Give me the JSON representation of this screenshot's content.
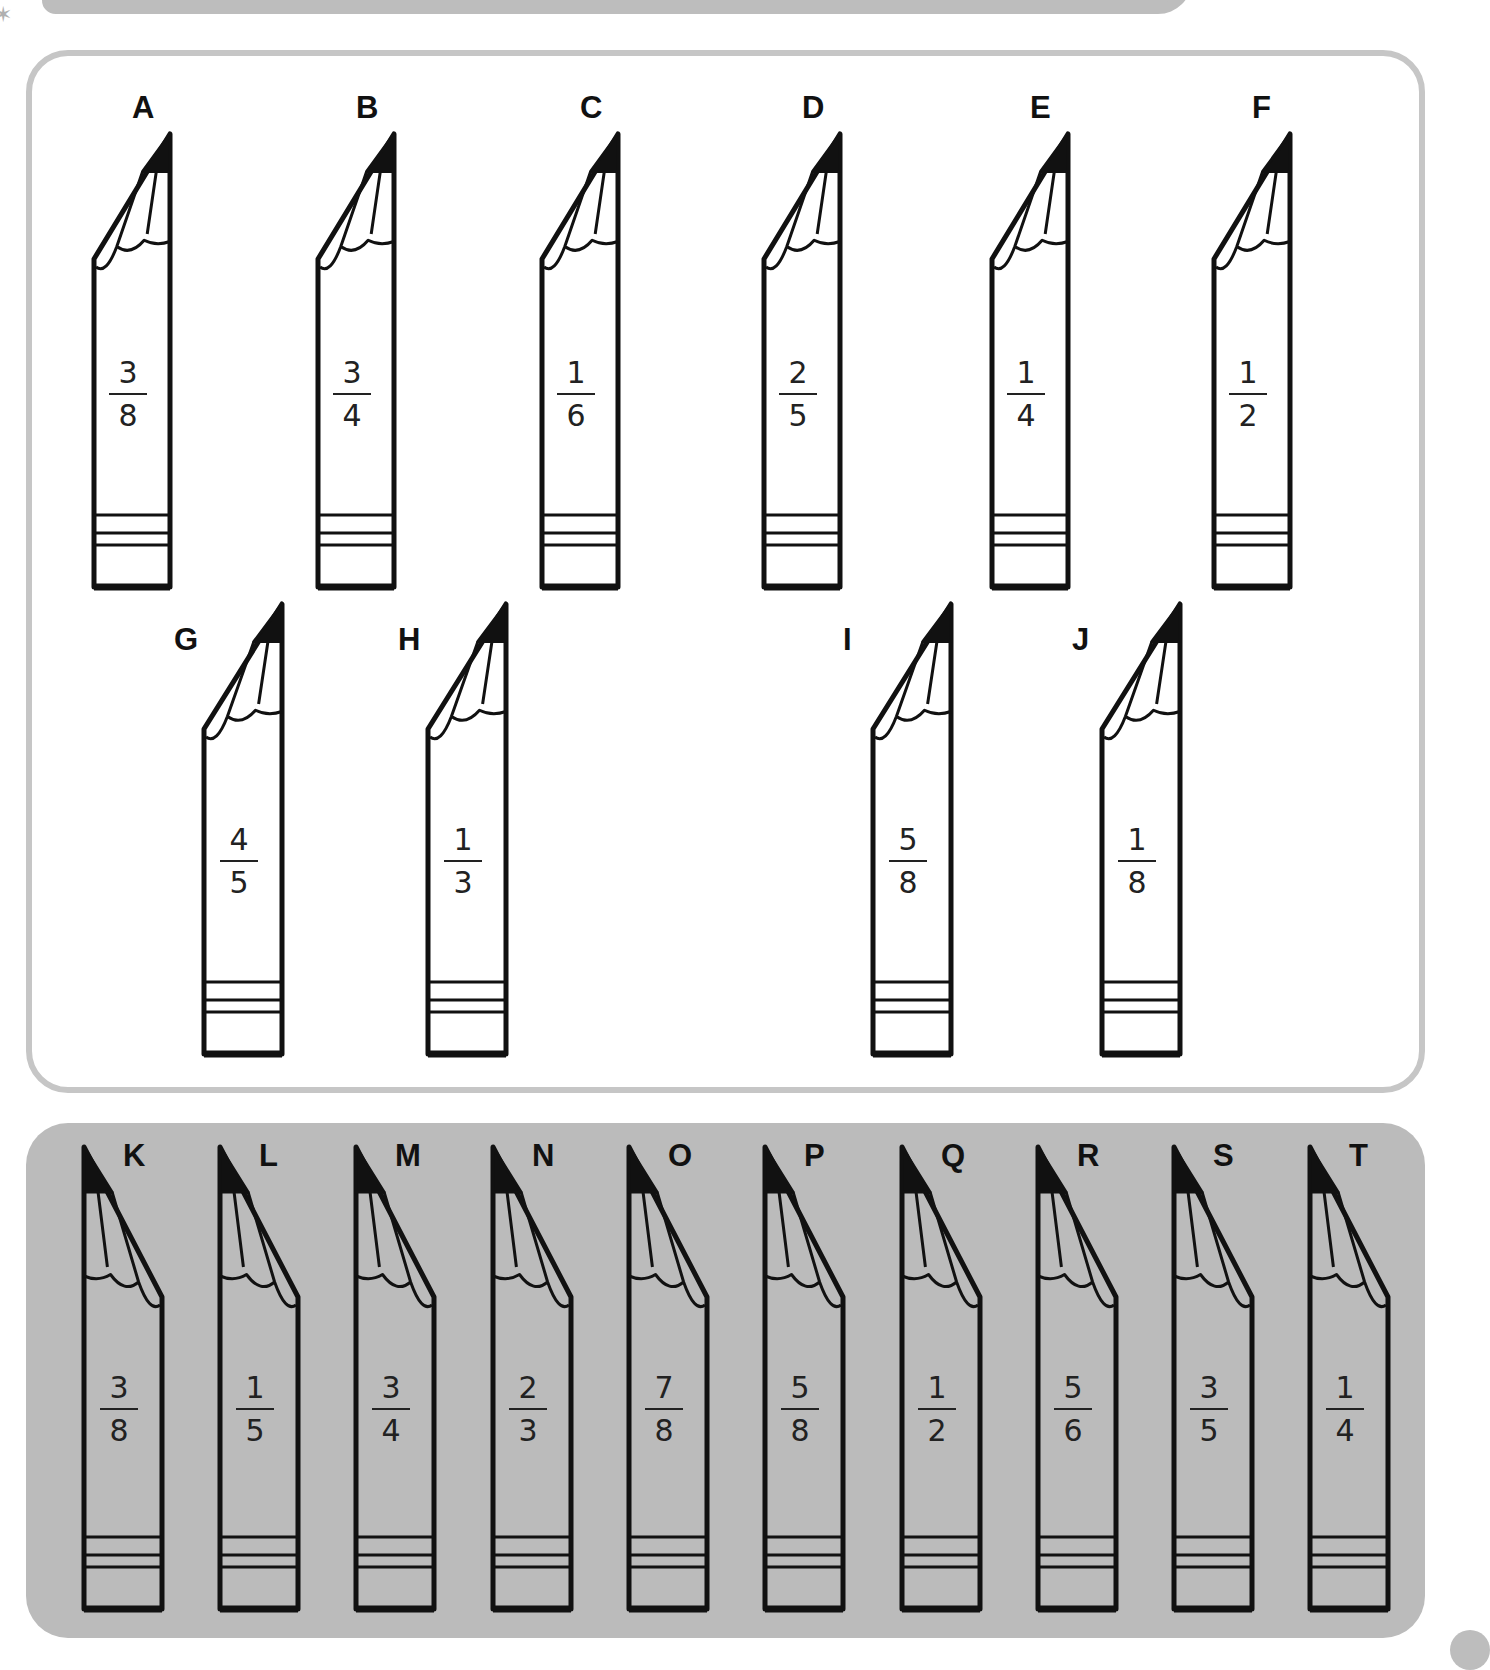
{
  "top_panel": {
    "pencils": [
      {
        "label": "A",
        "numerator": "3",
        "denominator": "8"
      },
      {
        "label": "B",
        "numerator": "3",
        "denominator": "4"
      },
      {
        "label": "C",
        "numerator": "1",
        "denominator": "6"
      },
      {
        "label": "D",
        "numerator": "2",
        "denominator": "5"
      },
      {
        "label": "E",
        "numerator": "1",
        "denominator": "4"
      },
      {
        "label": "F",
        "numerator": "1",
        "denominator": "2"
      },
      {
        "label": "G",
        "numerator": "4",
        "denominator": "5"
      },
      {
        "label": "H",
        "numerator": "1",
        "denominator": "3"
      },
      {
        "label": "I",
        "numerator": "5",
        "denominator": "8"
      },
      {
        "label": "J",
        "numerator": "1",
        "denominator": "8"
      }
    ]
  },
  "bottom_panel": {
    "pencils": [
      {
        "label": "K",
        "numerator": "3",
        "denominator": "8"
      },
      {
        "label": "L",
        "numerator": "1",
        "denominator": "5"
      },
      {
        "label": "M",
        "numerator": "3",
        "denominator": "4"
      },
      {
        "label": "N",
        "numerator": "2",
        "denominator": "3"
      },
      {
        "label": "O",
        "numerator": "7",
        "denominator": "8"
      },
      {
        "label": "P",
        "numerator": "5",
        "denominator": "8"
      },
      {
        "label": "Q",
        "numerator": "1",
        "denominator": "2"
      },
      {
        "label": "R",
        "numerator": "5",
        "denominator": "6"
      },
      {
        "label": "S",
        "numerator": "3",
        "denominator": "5"
      },
      {
        "label": "T",
        "numerator": "1",
        "denominator": "4"
      }
    ]
  },
  "colors": {
    "panel_border": "#c6c6c6",
    "panel_bottom_bg": "#bbbbbb",
    "ink": "#111111"
  }
}
